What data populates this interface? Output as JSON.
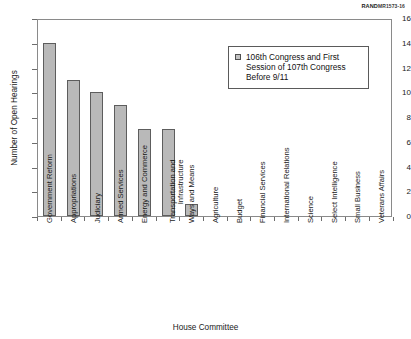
{
  "source_credit": {
    "brand": "RAND",
    "id": "MR1573-16"
  },
  "chart_data": {
    "type": "bar",
    "title": "",
    "xlabel": "House Committee",
    "ylabel": "Number of Open Hearings",
    "ylim": [
      0,
      16
    ],
    "ytick_step": 2,
    "ytick_labels": [
      "0",
      "2",
      "4",
      "6",
      "8",
      "10",
      "12",
      "14",
      "16"
    ],
    "grid": false,
    "legend_position": "upper-right-inside",
    "legend": [
      {
        "label": "106th Congress and First Session of 107th Congress Before 9/11",
        "line1": "106th Congress and First",
        "line2": "Session of 107th Congress",
        "line3": "Before 9/11",
        "swatch_color": "#c2c2c2"
      }
    ],
    "bar_color": "#b9b9b9",
    "bar_edge_color": "#5d5d5d",
    "categories": [
      "Government Reform",
      "Appropriations",
      "Judiciary",
      "Armed Services",
      "Energy and Commerce",
      "Transportation and Infrastructure",
      "Ways and Means",
      "Agriculture",
      "Budget",
      "Financial Services",
      "International Relations",
      "Science",
      "Select Intelligence",
      "Small Business",
      "Veterans Affairs"
    ],
    "category_lines": [
      [
        "Government Reform"
      ],
      [
        "Appropriations"
      ],
      [
        "Judiciary"
      ],
      [
        "Armed Services"
      ],
      [
        "Energy and Commerce"
      ],
      [
        "Transportation and",
        "Infrastructure"
      ],
      [
        "Ways and Means"
      ],
      [
        "Agriculture"
      ],
      [
        "Budget"
      ],
      [
        "Financial Services"
      ],
      [
        "International Relations"
      ],
      [
        "Science"
      ],
      [
        "Select Intelligence"
      ],
      [
        "Small Business"
      ],
      [
        "Veterans Affairs"
      ]
    ],
    "values": [
      14,
      11,
      10,
      9,
      7,
      7,
      1,
      0,
      0,
      0,
      0,
      0,
      0,
      0,
      0
    ]
  }
}
